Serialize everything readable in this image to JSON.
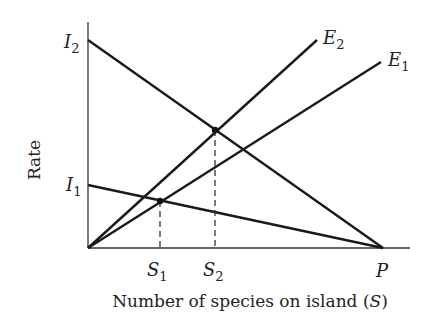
{
  "diagram": {
    "y_axis_label": "Rate",
    "x_axis_label_prefix": "Number of species on island (",
    "x_axis_label_var": "S",
    "x_axis_label_suffix": ")",
    "lines": [
      {
        "name": "I2",
        "label_base": "I",
        "label_sub": "2",
        "kind": "immigration",
        "from": [
          88,
          40
        ],
        "to": [
          383,
          248
        ]
      },
      {
        "name": "I1",
        "label_base": "I",
        "label_sub": "1",
        "kind": "immigration",
        "from": [
          88,
          185
        ],
        "to": [
          383,
          248
        ]
      },
      {
        "name": "E2",
        "label_base": "E",
        "label_sub": "2",
        "kind": "extinction",
        "from": [
          88,
          248
        ],
        "to": [
          317,
          40
        ]
      },
      {
        "name": "E1",
        "label_base": "E",
        "label_sub": "1",
        "kind": "extinction",
        "from": [
          88,
          248
        ],
        "to": [
          381,
          62
        ]
      }
    ],
    "equilibria": [
      {
        "name": "S1",
        "label_base": "S",
        "label_sub": "1",
        "point": [
          160,
          201
        ],
        "between": [
          "I1",
          "E1"
        ]
      },
      {
        "name": "S2",
        "label_base": "S",
        "label_sub": "2",
        "point": [
          215,
          130
        ],
        "between": [
          "I2",
          "E2"
        ]
      }
    ],
    "pool_marker": {
      "label": "P",
      "x": 383
    },
    "colors": {
      "line": "#1a1a1a",
      "axis": "#333333",
      "text": "#222222"
    }
  }
}
